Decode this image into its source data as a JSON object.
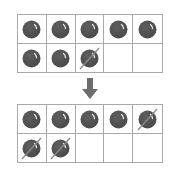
{
  "colors": {
    "counter": "#5f5f5f",
    "counter_dark": "#4a4a4a",
    "highlight": "#e8e8e8",
    "grid_line": "#a9a9a9",
    "cross_line": "#8a8a8a",
    "arrow": "#6d6d6d"
  },
  "frames": [
    {
      "name": "before-ten-frame",
      "cells": [
        "counter",
        "counter",
        "counter",
        "counter",
        "counter",
        "counter",
        "counter",
        "crossed",
        "empty",
        "empty"
      ]
    },
    {
      "name": "after-ten-frame",
      "cells": [
        "counter",
        "counter",
        "counter",
        "counter",
        "crossed",
        "crossed",
        "crossed",
        "empty",
        "empty",
        "empty"
      ]
    }
  ],
  "arrow": {
    "direction": "down",
    "icon": "arrow-down-icon"
  }
}
